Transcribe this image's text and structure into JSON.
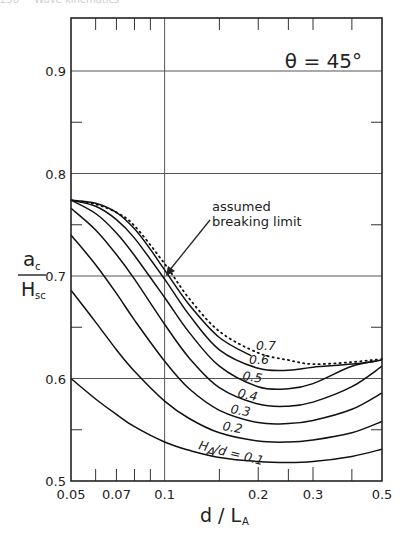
{
  "page_header": {
    "page_number": "256",
    "running_title": "Wave kinematics"
  },
  "chart_data": {
    "type": "line",
    "title": "θ = 45°",
    "xlabel": "d / L_A",
    "xlabel_main": "d / L",
    "xlabel_sub": "A",
    "ylabel_numerator": "a",
    "ylabel_numerator_sub": "c",
    "ylabel_denominator": "H",
    "ylabel_denominator_sub": "sc",
    "xscale": "log",
    "xlim": [
      0.05,
      0.5
    ],
    "ylim": [
      0.5,
      0.95
    ],
    "grid": true,
    "xticks_labeled": [
      "0.05",
      "0.07",
      "0.1",
      "0.2",
      "0.3",
      "0.5"
    ],
    "xtick_values": [
      0.05,
      0.07,
      0.1,
      0.2,
      0.3,
      0.5
    ],
    "xticks_minor": [
      0.06,
      0.07,
      0.08,
      0.09,
      0.15,
      0.2,
      0.25,
      0.3,
      0.4
    ],
    "xgrid": [
      0.1
    ],
    "yticks": [
      "0.5",
      "0.6",
      "0.7",
      "0.8",
      "0.9"
    ],
    "ytick_values": [
      0.5,
      0.6,
      0.7,
      0.8,
      0.9
    ],
    "yticks_minor": [
      0.55,
      0.65,
      0.75,
      0.85
    ],
    "ygrid": [
      0.6,
      0.7,
      0.8,
      0.9
    ],
    "legend": "curves labeled inline by H_A/d",
    "annotation": {
      "text_line1": "assumed",
      "text_line2": "breaking limit",
      "points_to": [
        0.1,
        0.7
      ]
    },
    "series": [
      {
        "name": "H_A/d = 0.1",
        "label": "H_A/d = 0.1",
        "x": [
          0.05,
          0.06,
          0.07,
          0.08,
          0.1,
          0.12,
          0.15,
          0.2,
          0.25,
          0.3,
          0.4,
          0.5
        ],
        "y": [
          0.6,
          0.58,
          0.565,
          0.553,
          0.538,
          0.53,
          0.523,
          0.519,
          0.518,
          0.519,
          0.524,
          0.531
        ]
      },
      {
        "name": "H_A/d = 0.2",
        "label": "0.2",
        "x": [
          0.05,
          0.06,
          0.07,
          0.08,
          0.1,
          0.12,
          0.15,
          0.2,
          0.25,
          0.3,
          0.4,
          0.5
        ],
        "y": [
          0.686,
          0.655,
          0.628,
          0.607,
          0.578,
          0.561,
          0.547,
          0.539,
          0.538,
          0.54,
          0.547,
          0.558
        ]
      },
      {
        "name": "H_A/d = 0.3",
        "label": "0.3",
        "x": [
          0.05,
          0.06,
          0.07,
          0.08,
          0.1,
          0.12,
          0.15,
          0.2,
          0.25,
          0.3,
          0.4,
          0.5
        ],
        "y": [
          0.74,
          0.711,
          0.683,
          0.657,
          0.617,
          0.59,
          0.569,
          0.557,
          0.556,
          0.559,
          0.57,
          0.586
        ]
      },
      {
        "name": "H_A/d = 0.4",
        "label": "0.4",
        "x": [
          0.05,
          0.06,
          0.07,
          0.08,
          0.1,
          0.12,
          0.15,
          0.2,
          0.25,
          0.3,
          0.4,
          0.5
        ],
        "y": [
          0.766,
          0.745,
          0.721,
          0.697,
          0.653,
          0.62,
          0.591,
          0.575,
          0.573,
          0.577,
          0.592,
          0.612
        ]
      },
      {
        "name": "H_A/d = 0.5",
        "label": "0.5",
        "x": [
          0.05,
          0.06,
          0.07,
          0.08,
          0.1,
          0.12,
          0.15,
          0.2,
          0.25,
          0.3,
          0.4,
          0.5
        ],
        "y": [
          0.774,
          0.761,
          0.742,
          0.72,
          0.679,
          0.645,
          0.612,
          0.592,
          0.59,
          0.595,
          0.612,
          0.618
        ]
      },
      {
        "name": "H_A/d = 0.6",
        "label": "0.6",
        "x": [
          0.05,
          0.06,
          0.07,
          0.08,
          0.1,
          0.12,
          0.15,
          0.2,
          0.25,
          0.3,
          0.4,
          0.48
        ],
        "y": [
          0.774,
          0.768,
          0.755,
          0.737,
          0.697,
          0.662,
          0.628,
          0.61,
          0.608,
          0.611,
          0.614,
          0.617
        ]
      },
      {
        "name": "H_A/d = 0.7",
        "label": "0.7",
        "x": [
          0.05,
          0.06,
          0.07,
          0.08,
          0.09,
          0.1,
          0.12,
          0.15,
          0.19
        ],
        "y": [
          0.774,
          0.771,
          0.762,
          0.746,
          0.726,
          0.706,
          0.672,
          0.64,
          0.622
        ]
      },
      {
        "name": "assumed breaking limit",
        "style": "dotted",
        "x": [
          0.05,
          0.06,
          0.07,
          0.08,
          0.1,
          0.12,
          0.15,
          0.2,
          0.25,
          0.3,
          0.4,
          0.5
        ],
        "y": [
          0.774,
          0.77,
          0.762,
          0.749,
          0.712,
          0.678,
          0.646,
          0.625,
          0.618,
          0.614,
          0.616,
          0.619
        ]
      }
    ]
  }
}
